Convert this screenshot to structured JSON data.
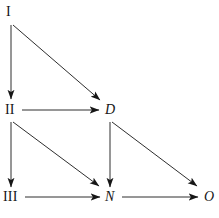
{
  "diagram": {
    "title": "",
    "ink_color": "#161616",
    "background_color": "#ffffff",
    "nodes": [
      {
        "id": "I",
        "label": "I",
        "style": "roman",
        "x": 12,
        "y": 16
      },
      {
        "id": "II",
        "label": "II",
        "style": "roman",
        "x": 12,
        "y": 112
      },
      {
        "id": "D",
        "label": "D",
        "style": "italic",
        "x": 110,
        "y": 112
      },
      {
        "id": "III",
        "label": "III",
        "style": "roman",
        "x": 12,
        "y": 199
      },
      {
        "id": "N",
        "label": "N",
        "style": "italic",
        "x": 110,
        "y": 199
      },
      {
        "id": "O",
        "label": "O",
        "style": "italic",
        "x": 209,
        "y": 199
      }
    ],
    "edges": [
      {
        "id": "I-to-II",
        "from": "I",
        "to": "II",
        "kind": "vertical",
        "x1": 11,
        "y1": 25,
        "x2": 11,
        "y2": 99
      },
      {
        "id": "I-to-D",
        "from": "I",
        "to": "D",
        "kind": "diagonal",
        "x1": 13,
        "y1": 25,
        "x2": 100,
        "y2": 100
      },
      {
        "id": "II-to-D",
        "from": "II",
        "to": "D",
        "kind": "horizontal",
        "x1": 22,
        "y1": 110,
        "x2": 99,
        "y2": 110
      },
      {
        "id": "II-to-III",
        "from": "II",
        "to": "III",
        "kind": "vertical",
        "x1": 11,
        "y1": 122,
        "x2": 11,
        "y2": 187
      },
      {
        "id": "II-to-N",
        "from": "II",
        "to": "N",
        "kind": "diagonal",
        "x1": 13,
        "y1": 122,
        "x2": 99,
        "y2": 186
      },
      {
        "id": "D-to-N",
        "from": "D",
        "to": "N",
        "kind": "vertical",
        "x1": 110,
        "y1": 122,
        "x2": 110,
        "y2": 187
      },
      {
        "id": "D-to-O",
        "from": "D",
        "to": "O",
        "kind": "diagonal",
        "x1": 112,
        "y1": 122,
        "x2": 197,
        "y2": 186
      },
      {
        "id": "III-to-N",
        "from": "III",
        "to": "N",
        "kind": "horizontal",
        "x1": 25,
        "y1": 197,
        "x2": 100,
        "y2": 197
      },
      {
        "id": "N-to-O",
        "from": "N",
        "to": "O",
        "kind": "horizontal",
        "x1": 122,
        "y1": 197,
        "x2": 198,
        "y2": 197
      }
    ]
  }
}
